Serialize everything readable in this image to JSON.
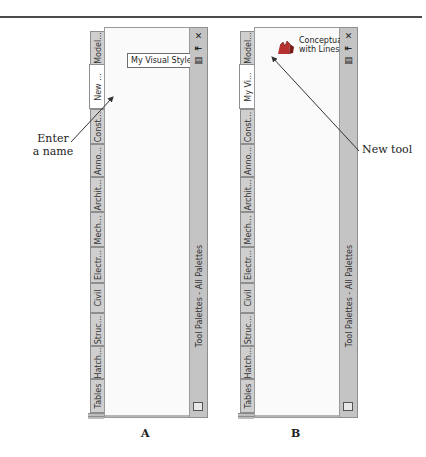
{
  "figure": {
    "panel_a_label": "A",
    "panel_b_label": "B",
    "callout_a": "Enter\na name",
    "callout_a_line1": "Enter",
    "callout_a_line2": "a name",
    "callout_b": "New tool"
  },
  "palette_a": {
    "caption": "Tool Palettes - All Palettes",
    "title_buttons": [
      "close-icon",
      "auto-hide-icon",
      "properties-icon"
    ],
    "close_glyph": "✕",
    "autohide_glyph": "⇤",
    "properties_glyph": "▤",
    "tabs": [
      {
        "label": "Model...",
        "active": false
      },
      {
        "label": "New ...",
        "active": true
      },
      {
        "label": "Const...",
        "active": false
      },
      {
        "label": "Anno...",
        "active": false
      },
      {
        "label": "Archit...",
        "active": false
      },
      {
        "label": "Mech...",
        "active": false
      },
      {
        "label": "Electr...",
        "active": false
      },
      {
        "label": "Civil",
        "active": false
      },
      {
        "label": "Struc...",
        "active": false
      },
      {
        "label": "Hatch...",
        "active": false
      },
      {
        "label": "Tables",
        "active": false
      }
    ],
    "name_field_value": "My Visual Styles"
  },
  "palette_b": {
    "caption": "Tool Palettes - All Palettes",
    "close_glyph": "✕",
    "autohide_glyph": "⇤",
    "properties_glyph": "▤",
    "tabs": [
      {
        "label": "Model...",
        "active": false
      },
      {
        "label": "My Vi...",
        "active": true
      },
      {
        "label": "Const...",
        "active": false
      },
      {
        "label": "Anno...",
        "active": false
      },
      {
        "label": "Archit...",
        "active": false
      },
      {
        "label": "Mech...",
        "active": false
      },
      {
        "label": "Electr...",
        "active": false
      },
      {
        "label": "Civil",
        "active": false
      },
      {
        "label": "Struc...",
        "active": false
      },
      {
        "label": "Hatch...",
        "active": false
      },
      {
        "label": "Tables",
        "active": false
      }
    ],
    "tool": {
      "label_line1": "Conceptual",
      "label_line2": "with Lines",
      "icon": "visual-style-icon",
      "icon_color": "#b5322e"
    }
  }
}
